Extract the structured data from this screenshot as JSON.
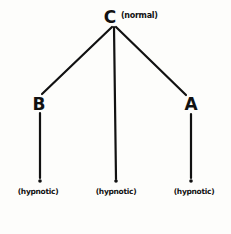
{
  "diagram": {
    "root": {
      "label": "C",
      "note": "(normal)"
    },
    "children": [
      {
        "label": "B",
        "leaf_label": "(hypnotic)"
      },
      {
        "label": "",
        "leaf_label": "(hypnotic)"
      },
      {
        "label": "A",
        "leaf_label": "(hypnotic)"
      }
    ]
  },
  "colors": {
    "ink": "#111111",
    "paper": "#fdfdfb"
  }
}
